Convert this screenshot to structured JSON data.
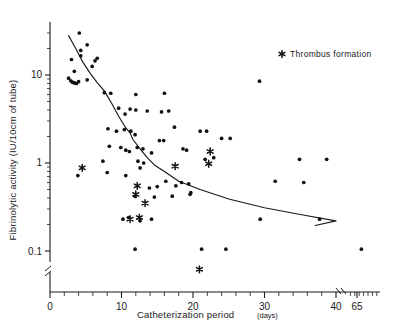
{
  "chart_data": {
    "type": "scatter",
    "title": "",
    "xlabel": "Catheterization period",
    "xlabel_unit": "(days)",
    "ylabel": "Fibrinolytic activity (IU/10cm of tube)",
    "xscale": "linear-with-break",
    "yscale": "log",
    "ylim": [
      0.07,
      40
    ],
    "xlim": [
      0,
      70
    ],
    "grid": false,
    "x_ticks": [
      0,
      10,
      20,
      30,
      40,
      65
    ],
    "x_tick_labels": [
      "0",
      "10",
      "20",
      "30",
      "40",
      "65"
    ],
    "x_minor_tick_step": 2,
    "x_axis_break_between": [
      40,
      65
    ],
    "y_ticks": [
      10,
      1,
      0.1
    ],
    "y_tick_labels": [
      "10",
      "1",
      "0.1"
    ],
    "y_axis_break_near": 0.075,
    "legend": {
      "position": "top-right",
      "entries": [
        {
          "marker": "asterisk",
          "label": "Thrombus formation"
        }
      ]
    },
    "series": [
      {
        "name": "Normal catheter samples",
        "marker": "dot",
        "color": "#111111",
        "points": [
          [
            3.0,
            15.0
          ],
          [
            4.1,
            30.0
          ],
          [
            4.3,
            19.0
          ],
          [
            4.3,
            16.5
          ],
          [
            5.2,
            22.0
          ],
          [
            5.9,
            12.5
          ],
          [
            6.3,
            14.5
          ],
          [
            2.6,
            9.2
          ],
          [
            2.9,
            8.6
          ],
          [
            3.1,
            8.3
          ],
          [
            3.3,
            8.2
          ],
          [
            3.5,
            8.1
          ],
          [
            3.7,
            8.0
          ],
          [
            4.0,
            8.4
          ],
          [
            3.4,
            11.0
          ],
          [
            5.2,
            8.8
          ],
          [
            6.6,
            15.5
          ],
          [
            7.6,
            6.3
          ],
          [
            8.5,
            6.2
          ],
          [
            12.0,
            6.0
          ],
          [
            16.0,
            6.2
          ],
          [
            9.6,
            4.2
          ],
          [
            10.5,
            3.6
          ],
          [
            11.2,
            4.1
          ],
          [
            12.0,
            4.0
          ],
          [
            13.6,
            3.9
          ],
          [
            15.6,
            3.8
          ],
          [
            16.6,
            3.9
          ],
          [
            10.4,
            2.4
          ],
          [
            11.3,
            2.3
          ],
          [
            11.9,
            2.1
          ],
          [
            8.3,
            1.55
          ],
          [
            9.9,
            1.5
          ],
          [
            10.6,
            1.4
          ],
          [
            11.1,
            1.35
          ],
          [
            12.2,
            1.5
          ],
          [
            13.0,
            1.45
          ],
          [
            14.2,
            1.3
          ],
          [
            15.3,
            1.8
          ],
          [
            15.9,
            1.8
          ],
          [
            18.6,
            1.45
          ],
          [
            19.1,
            1.4
          ],
          [
            12.3,
            1.05
          ],
          [
            13.1,
            1.0
          ],
          [
            7.4,
            1.05
          ],
          [
            21.7,
            1.1
          ],
          [
            22.9,
            1.15
          ],
          [
            8.0,
            0.78
          ],
          [
            10.6,
            0.72
          ],
          [
            3.9,
            0.72
          ],
          [
            29.3,
            8.5
          ],
          [
            17.4,
            2.55
          ],
          [
            21.0,
            2.3
          ],
          [
            21.9,
            2.3
          ],
          [
            16.2,
            0.62
          ],
          [
            17.6,
            0.55
          ],
          [
            18.4,
            0.6
          ],
          [
            19.4,
            0.58
          ],
          [
            19.7,
            0.46
          ],
          [
            19.6,
            0.44
          ],
          [
            15.0,
            0.54
          ],
          [
            13.9,
            0.52
          ],
          [
            11.9,
            0.42
          ],
          [
            14.6,
            0.41
          ],
          [
            12.6,
            0.88
          ],
          [
            17.1,
            0.42
          ],
          [
            14.2,
            0.23
          ],
          [
            10.2,
            0.23
          ],
          [
            11.0,
            0.24
          ],
          [
            12.6,
            0.22
          ],
          [
            11.9,
            0.105
          ],
          [
            21.2,
            0.105
          ],
          [
            24.6,
            0.105
          ],
          [
            31.5,
            0.62
          ],
          [
            34.9,
            1.1
          ],
          [
            38.7,
            1.1
          ],
          [
            40.8,
            0.6
          ],
          [
            29.4,
            0.23
          ],
          [
            48.0,
            0.23
          ],
          [
            67.0,
            0.105
          ],
          [
            24.0,
            1.9
          ],
          [
            25.2,
            1.9
          ],
          [
            8.1,
            2.45
          ],
          [
            9.3,
            2.3
          ]
        ]
      },
      {
        "name": "Thrombus formation",
        "marker": "asterisk",
        "color": "#111111",
        "points": [
          [
            4.5,
            0.88
          ],
          [
            12.0,
            0.44
          ],
          [
            13.3,
            0.35
          ],
          [
            12.2,
            0.55
          ],
          [
            11.2,
            0.23
          ],
          [
            12.5,
            0.24
          ],
          [
            17.5,
            0.92
          ],
          [
            22.4,
            1.35
          ],
          [
            22.2,
            0.98
          ],
          [
            20.9,
            0.062
          ]
        ]
      }
    ],
    "fit_curve": {
      "name": "fitted-regression-curve",
      "color": "#1a1a1a",
      "points": [
        [
          2.6,
          28.0
        ],
        [
          3.6,
          20.0
        ],
        [
          4.6,
          14.0
        ],
        [
          5.6,
          10.5
        ],
        [
          6.6,
          8.2
        ],
        [
          7.6,
          6.6
        ],
        [
          8.6,
          4.8
        ],
        [
          9.6,
          3.4
        ],
        [
          10.6,
          2.5
        ],
        [
          11.2,
          2.2
        ],
        [
          11.6,
          1.85
        ],
        [
          12.6,
          1.45
        ],
        [
          13.6,
          1.15
        ],
        [
          14.6,
          0.95
        ],
        [
          16.0,
          0.8
        ],
        [
          18.0,
          0.62
        ],
        [
          21.0,
          0.5
        ],
        [
          25.0,
          0.39
        ],
        [
          30.0,
          0.31
        ],
        [
          35.0,
          0.26
        ],
        [
          40.0,
          0.22
        ],
        [
          46.0,
          0.195
        ]
      ]
    }
  }
}
